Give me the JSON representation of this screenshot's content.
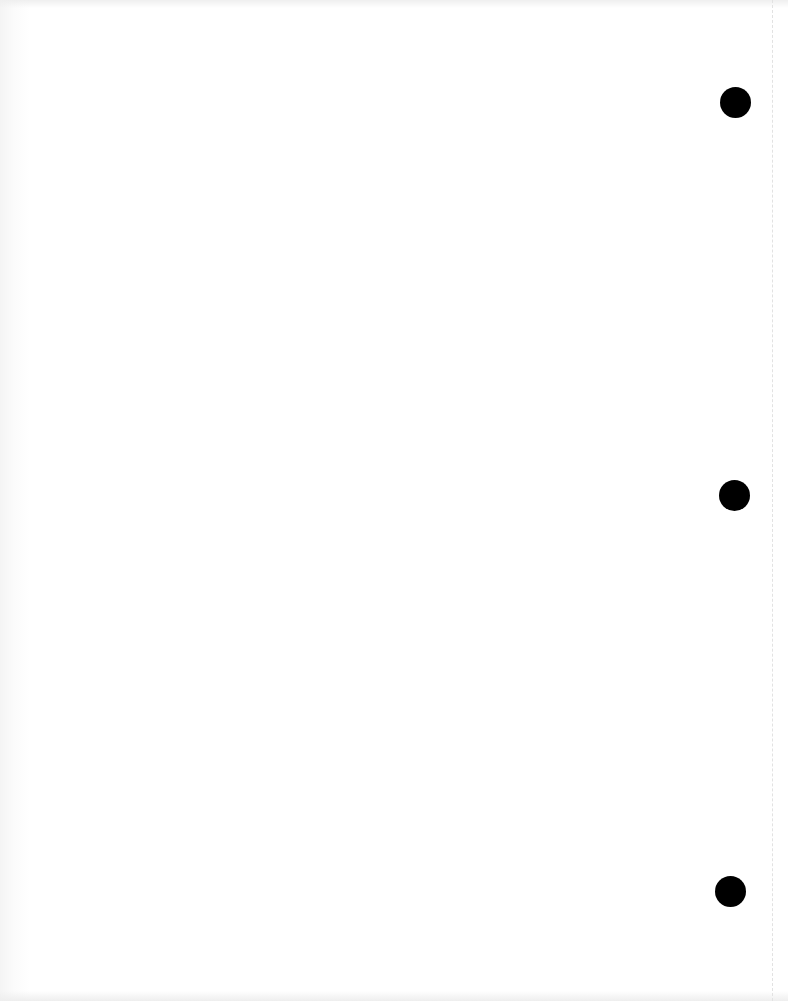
{
  "document": {
    "type": "blank-scanned-page",
    "background_color": "#ffffff",
    "punch_holes": [
      {
        "cx": 735,
        "cy": 102,
        "r": 15
      },
      {
        "cx": 734,
        "cy": 495,
        "r": 15
      },
      {
        "cx": 730,
        "cy": 891,
        "r": 15
      }
    ],
    "hole_color": "#000000",
    "edge_line_x": 772
  }
}
